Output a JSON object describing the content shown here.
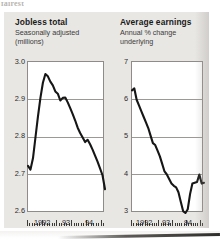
{
  "page": {
    "top_bleed_text": "fairest",
    "panel_background": "#e9e7e4",
    "plot_background": "#ffffff",
    "line_color": "#161616",
    "grid_color": "#9b9895",
    "axis_color": "#8e8b88"
  },
  "chart_data": [
    {
      "id": "jobless-total",
      "type": "line",
      "title": "Jobless total",
      "subtitle_line1": "Seasonally adjusted",
      "subtitle_line2": "(millions)",
      "xlabel": "",
      "ylabel": "millions",
      "ylim": [
        2.6,
        3.0
      ],
      "yticks": [
        3.0,
        2.9,
        2.8,
        2.7,
        2.6
      ],
      "ytick_labels": [
        "3.0",
        "2.9",
        "2.8",
        "2.7",
        "2.6"
      ],
      "grid": true,
      "legend": "none",
      "xlim": [
        "1992-01",
        "1994-06"
      ],
      "xtick_labels": [
        "1992",
        "93",
        "94"
      ],
      "xtick_label_positions": [
        0.18,
        0.52,
        0.81
      ],
      "x_minor_ticks": 31,
      "series": [
        {
          "name": "Jobless total (millions)",
          "x": [
            "1991-11",
            "1991-12",
            "1992-01",
            "1992-02",
            "1992-03",
            "1992-04",
            "1992-05",
            "1992-06",
            "1992-07",
            "1992-08",
            "1992-09",
            "1992-10",
            "1992-11",
            "1992-12",
            "1993-01",
            "1993-02",
            "1993-03",
            "1993-04",
            "1993-05",
            "1993-06",
            "1993-07",
            "1993-08",
            "1993-09",
            "1993-10",
            "1993-11",
            "1993-12",
            "1994-01",
            "1994-02",
            "1994-03",
            "1994-04",
            "1994-05",
            "1994-06"
          ],
          "values": [
            2.725,
            2.715,
            2.745,
            2.8,
            2.855,
            2.905,
            2.945,
            2.968,
            2.962,
            2.948,
            2.938,
            2.922,
            2.916,
            2.898,
            2.905,
            2.906,
            2.893,
            2.878,
            2.862,
            2.845,
            2.826,
            2.812,
            2.8,
            2.788,
            2.794,
            2.782,
            2.768,
            2.752,
            2.736,
            2.718,
            2.7,
            2.663
          ]
        }
      ]
    },
    {
      "id": "average-earnings",
      "type": "line",
      "title": "Average earnings",
      "subtitle_line1": "Annual % change",
      "subtitle_line2": "underlying",
      "xlabel": "",
      "ylabel": "Annual % change",
      "ylim": [
        3,
        7
      ],
      "yticks": [
        7,
        6,
        5,
        4,
        3
      ],
      "ytick_labels": [
        "7",
        "6",
        "5",
        "4",
        "3"
      ],
      "grid": true,
      "legend": "none",
      "xlim": [
        "1992-01",
        "1994-06"
      ],
      "xtick_labels": [
        "1992",
        "93",
        "94"
      ],
      "xtick_label_positions": [
        0.17,
        0.5,
        0.79
      ],
      "x_minor_ticks": 31,
      "series": [
        {
          "name": "Average earnings, annual % change underlying",
          "x": [
            "1991-11",
            "1991-12",
            "1992-01",
            "1992-02",
            "1992-03",
            "1992-04",
            "1992-05",
            "1992-06",
            "1992-07",
            "1992-08",
            "1992-09",
            "1992-10",
            "1992-11",
            "1992-12",
            "1993-01",
            "1993-02",
            "1993-03",
            "1993-04",
            "1993-05",
            "1993-06",
            "1993-07",
            "1993-08",
            "1993-09",
            "1993-10",
            "1993-11",
            "1993-12",
            "1994-01",
            "1994-02",
            "1994-03",
            "1994-04",
            "1994-05",
            "1994-06"
          ],
          "values": [
            6.25,
            6.3,
            6.0,
            5.85,
            5.7,
            5.55,
            5.4,
            5.25,
            5.05,
            4.85,
            4.8,
            4.65,
            4.5,
            4.3,
            4.1,
            4.02,
            3.9,
            3.78,
            3.72,
            3.68,
            3.55,
            3.3,
            3.05,
            3.0,
            3.1,
            3.5,
            3.78,
            3.8,
            3.82,
            4.02,
            3.78,
            3.8
          ]
        }
      ]
    }
  ]
}
